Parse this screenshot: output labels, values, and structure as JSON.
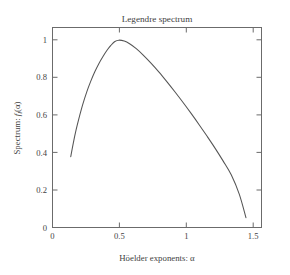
{
  "chart_data": {
    "type": "line",
    "title": "Legendre spectrum",
    "xlabel": "Höelder exponents: α",
    "ylabel_prefix": "Spectrum: ",
    "ylabel_sym": "f",
    "ylabel_sub": "l",
    "ylabel_arg": "(α)",
    "ylabel": "Spectrum: f_l(α)",
    "xlim": [
      0,
      1.57
    ],
    "ylim": [
      0,
      1.07
    ],
    "grid": false,
    "legend": "none",
    "xticks": [
      0,
      0.5,
      1,
      1.5
    ],
    "xticklabels": [
      "0",
      "0.5",
      "1",
      "1.5"
    ],
    "yticks": [
      0,
      0.2,
      0.4,
      0.6,
      0.8,
      1
    ],
    "yticklabels": [
      "0",
      "0.2",
      "0.4",
      "0.6",
      "0.8",
      "1"
    ],
    "line_color": "#555555",
    "frame_color": "#6b6b6b",
    "series": [
      {
        "name": "Legendre spectrum",
        "x": [
          0.14,
          0.16,
          0.18,
          0.2,
          0.23,
          0.26,
          0.29,
          0.32,
          0.35,
          0.38,
          0.41,
          0.44,
          0.47,
          0.5,
          0.54,
          0.58,
          0.63,
          0.68,
          0.74,
          0.8,
          0.86,
          0.92,
          0.98,
          1.04,
          1.1,
          1.16,
          1.22,
          1.28,
          1.34,
          1.4,
          1.45
        ],
        "y": [
          0.38,
          0.455,
          0.522,
          0.58,
          0.658,
          0.725,
          0.782,
          0.832,
          0.875,
          0.912,
          0.945,
          0.972,
          0.993,
          1.0,
          0.995,
          0.981,
          0.955,
          0.922,
          0.878,
          0.83,
          0.778,
          0.724,
          0.668,
          0.61,
          0.55,
          0.488,
          0.424,
          0.356,
          0.283,
          0.18,
          0.055
        ]
      }
    ]
  },
  "axes_geometry": {
    "plot_left": 52,
    "plot_right": 262,
    "plot_top": 27,
    "plot_bottom": 228
  }
}
